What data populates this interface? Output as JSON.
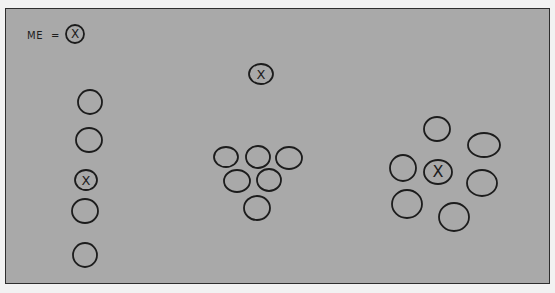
{
  "legend": {
    "label": "ME",
    "equals": "=",
    "symbol": "X",
    "circle": {
      "cx": 75,
      "cy": 34,
      "rx": 9,
      "ry": 9
    }
  },
  "colors": {
    "background": "#a9a9a9",
    "frame_border": "#2e2e2e",
    "ink": "#1c1c1c"
  },
  "groups": [
    {
      "name": "column-formation",
      "circles": [
        {
          "cx": 90,
          "cy": 102,
          "rx": 12,
          "ry": 12,
          "marked": false
        },
        {
          "cx": 89,
          "cy": 140,
          "rx": 13,
          "ry": 12,
          "marked": false
        },
        {
          "cx": 86,
          "cy": 180,
          "rx": 11,
          "ry": 10,
          "marked": true
        },
        {
          "cx": 85,
          "cy": 211,
          "rx": 13,
          "ry": 12,
          "marked": false
        },
        {
          "cx": 85,
          "cy": 255,
          "rx": 12,
          "ry": 12,
          "marked": false
        }
      ]
    },
    {
      "name": "apart-from-cluster-formation",
      "circles": [
        {
          "cx": 261,
          "cy": 74,
          "rx": 12,
          "ry": 10,
          "marked": true
        },
        {
          "cx": 226,
          "cy": 157,
          "rx": 12,
          "ry": 10,
          "marked": false
        },
        {
          "cx": 258,
          "cy": 157,
          "rx": 12,
          "ry": 11,
          "marked": false
        },
        {
          "cx": 289,
          "cy": 158,
          "rx": 13,
          "ry": 11,
          "marked": false
        },
        {
          "cx": 237,
          "cy": 181,
          "rx": 13,
          "ry": 11,
          "marked": false
        },
        {
          "cx": 269,
          "cy": 180,
          "rx": 12,
          "ry": 11,
          "marked": false
        },
        {
          "cx": 257,
          "cy": 208,
          "rx": 13,
          "ry": 12,
          "marked": false
        }
      ]
    },
    {
      "name": "surrounded-formation",
      "circles": [
        {
          "cx": 437,
          "cy": 129,
          "rx": 13,
          "ry": 12,
          "marked": false
        },
        {
          "cx": 484,
          "cy": 145,
          "rx": 16,
          "ry": 12,
          "marked": false
        },
        {
          "cx": 403,
          "cy": 168,
          "rx": 13,
          "ry": 13,
          "marked": false
        },
        {
          "cx": 438,
          "cy": 172,
          "rx": 14,
          "ry": 12,
          "marked": true
        },
        {
          "cx": 482,
          "cy": 183,
          "rx": 15,
          "ry": 13,
          "marked": false
        },
        {
          "cx": 407,
          "cy": 204,
          "rx": 15,
          "ry": 14,
          "marked": false
        },
        {
          "cx": 454,
          "cy": 217,
          "rx": 15,
          "ry": 14,
          "marked": false
        }
      ]
    }
  ]
}
